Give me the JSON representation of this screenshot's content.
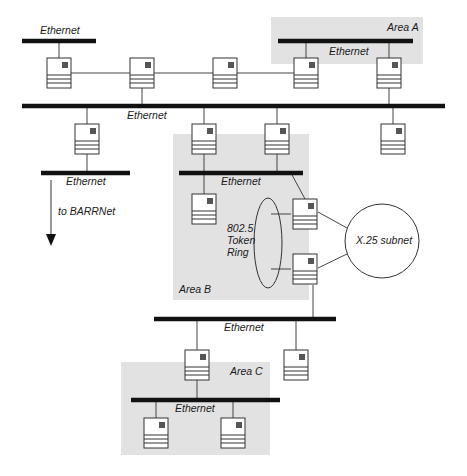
{
  "diagram": {
    "type": "network-topology",
    "colors": {
      "area_fill": "#e2e2e2",
      "bus": "#111111",
      "wire": "#444444",
      "router_led": "#555555"
    },
    "areas": [
      {
        "id": "area-a",
        "label": "Area A"
      },
      {
        "id": "area-b",
        "label": "Area B"
      },
      {
        "id": "area-c",
        "label": "Area C"
      }
    ],
    "networks": [
      {
        "id": "eth-top-left",
        "label": "Ethernet"
      },
      {
        "id": "eth-area-a",
        "label": "Ethernet"
      },
      {
        "id": "eth-backbone",
        "label": "Ethernet"
      },
      {
        "id": "eth-lower-left",
        "label": "Ethernet"
      },
      {
        "id": "eth-area-b",
        "label": "Ethernet"
      },
      {
        "id": "eth-lower",
        "label": "Ethernet"
      },
      {
        "id": "eth-area-c",
        "label": "Ethernet"
      }
    ],
    "token_ring": {
      "line1": "802.5",
      "line2": "Token",
      "line3": "Ring"
    },
    "x25": {
      "label": "X.25 subnet"
    },
    "external": {
      "label": "to BARRNet"
    }
  }
}
